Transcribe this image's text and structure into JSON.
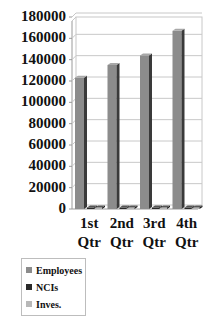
{
  "chart_data": {
    "type": "bar",
    "title": "",
    "xlabel": "",
    "ylabel": "",
    "ylim": [
      0,
      180000
    ],
    "yticks": [
      0,
      20000,
      40000,
      60000,
      80000,
      100000,
      120000,
      140000,
      160000,
      180000
    ],
    "ytick_labels": [
      "0",
      "20000",
      "40000",
      "60000",
      "80000",
      "100000",
      "120000",
      "140000",
      "160000",
      "180000"
    ],
    "categories": [
      "1st Qtr",
      "2nd Qtr",
      "3rd Qtr",
      "4th Qtr"
    ],
    "category_lines": [
      [
        "1st",
        "Qtr"
      ],
      [
        "2nd",
        "Qtr"
      ],
      [
        "3rd",
        "Qtr"
      ],
      [
        "4th",
        "Qtr"
      ]
    ],
    "series": [
      {
        "name": "Employees",
        "color": "#8c8c8c",
        "values": [
          123000,
          135000,
          144000,
          167000
        ]
      },
      {
        "name": "NCIs",
        "color": "#2a2a2a",
        "values": [
          800,
          800,
          800,
          800
        ]
      },
      {
        "name": "Inves.",
        "color": "#b8b8b8",
        "values": [
          300,
          300,
          300,
          300
        ]
      }
    ],
    "grid": true,
    "legend_position": "bottom-left",
    "style": "3d-clustered-column"
  },
  "legend": {
    "items": [
      {
        "label": "Employees",
        "color": "#8c8c8c"
      },
      {
        "label": "NCIs",
        "color": "#2a2a2a"
      },
      {
        "label": "Inves.",
        "color": "#b8b8b8"
      }
    ]
  }
}
